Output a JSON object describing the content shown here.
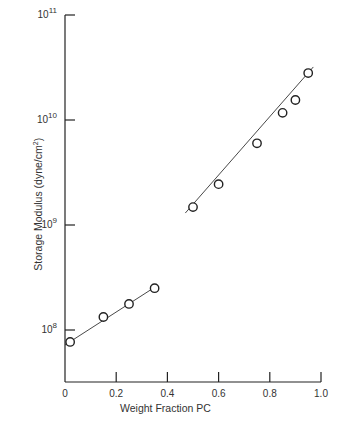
{
  "chart_data": {
    "type": "scatter",
    "title": "",
    "xlabel": "Weight Fraction PC",
    "ylabel": "Storage Modulus (dyne/cm²)",
    "ylabel_parts": {
      "text": "Storage Modulus (dyne/cm",
      "sup": "2",
      "close": ")"
    },
    "xlim": [
      0,
      1.0
    ],
    "ylim": [
      30000000.0,
      100000000000.0
    ],
    "yscale": "log",
    "xticks": [
      0,
      0.2,
      0.4,
      0.6,
      0.8,
      1.0
    ],
    "xtick_labels": [
      "0",
      "0.2",
      "0.4",
      "0.6",
      "0.8",
      "1.0"
    ],
    "yticks": [
      100000000.0,
      1000000000.0,
      10000000000.0,
      100000000000.0
    ],
    "ytick_labels": [
      {
        "base": "10",
        "exp": "8"
      },
      {
        "base": "10",
        "exp": "9"
      },
      {
        "base": "10",
        "exp": "10"
      },
      {
        "base": "10",
        "exp": "11"
      }
    ],
    "grid": false,
    "legend": null,
    "series": [
      {
        "name": "low PC branch",
        "marker": "open-circle",
        "fit_line": true,
        "x": [
          0.02,
          0.15,
          0.25,
          0.35
        ],
        "y": [
          77000000.0,
          133000000.0,
          177000000.0,
          250000000.0
        ]
      },
      {
        "name": "high PC branch",
        "marker": "open-circle",
        "fit_line": true,
        "x": [
          0.5,
          0.6,
          0.75,
          0.85,
          0.9,
          0.95
        ],
        "y": [
          1480000000.0,
          2450000000.0,
          6000000000.0,
          11700000000.0,
          15500000000.0,
          28000000000.0
        ]
      }
    ],
    "fit_lines": [
      {
        "from": [
          0.0,
          72000000.0
        ],
        "to": [
          0.35,
          255000000.0
        ]
      },
      {
        "from": [
          0.47,
          1300000000.0
        ],
        "to": [
          0.97,
          32000000000.0
        ]
      }
    ]
  }
}
